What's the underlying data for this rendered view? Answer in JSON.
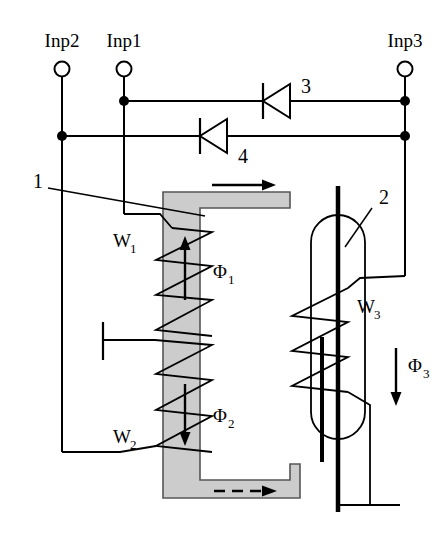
{
  "figure": {
    "background_color": "#ffffff",
    "line_color": "#000000",
    "core_fill_color": "#cccccc",
    "core_stroke_color": "#555555"
  },
  "terminals": [
    {
      "id": "inp2",
      "label": "Inp2",
      "x": 62,
      "y": 69
    },
    {
      "id": "inp1",
      "label": "Inp1",
      "x": 124,
      "y": 69
    },
    {
      "id": "inp3",
      "label": "Inp3",
      "x": 405,
      "y": 69
    }
  ],
  "diodes": [
    {
      "id": "diode3",
      "label": "3",
      "direction": "left",
      "x": 275,
      "y": 101
    },
    {
      "id": "diode4",
      "label": "4",
      "direction": "left",
      "x": 212,
      "y": 136
    }
  ],
  "parts": [
    {
      "id": "part1",
      "label": "1",
      "description": "magnetic core",
      "x": 33,
      "y": 181
    },
    {
      "id": "part2",
      "label": "2",
      "description": "reactor / gas tube",
      "x": 379,
      "y": 198
    }
  ],
  "windings": [
    {
      "id": "w1",
      "label": "W",
      "subscript": "1",
      "x": 113,
      "y": 247
    },
    {
      "id": "w2",
      "label": "W",
      "subscript": "2",
      "x": 113,
      "y": 443
    },
    {
      "id": "w3",
      "label": "W",
      "subscript": "3",
      "x": 357,
      "y": 313
    }
  ],
  "fluxes": [
    {
      "id": "phi1",
      "label": "Φ",
      "subscript": "1",
      "x": 213,
      "y": 278,
      "arrow_direction": "up"
    },
    {
      "id": "phi2",
      "label": "Φ",
      "subscript": "2",
      "x": 213,
      "y": 422,
      "arrow_direction": "down"
    },
    {
      "id": "phi3",
      "label": "Φ",
      "subscript": "3",
      "x": 402,
      "y": 372,
      "arrow_direction": "down"
    }
  ],
  "core_arrows": [
    {
      "id": "top-core-arrow",
      "style": "solid",
      "direction": "right"
    },
    {
      "id": "bottom-core-arrow",
      "style": "dashed",
      "direction": "right"
    }
  ],
  "ground": {
    "id": "ground-symbol",
    "x": 355,
    "y": 505
  }
}
